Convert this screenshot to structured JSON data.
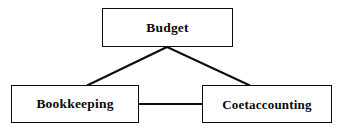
{
  "diagram": {
    "type": "hierarchy-tree",
    "background_color": "#ffffff",
    "line_color": "#0d0d0d",
    "text_color": "#0a0a0a",
    "nodes": [
      {
        "id": "budget",
        "label": "Budget",
        "level": "root"
      },
      {
        "id": "bookkeeping",
        "label": "Bookkeeping",
        "level": "child"
      },
      {
        "id": "costaccounting",
        "label": "Coetaccounting",
        "level": "child"
      }
    ],
    "edges": [
      {
        "from": "budget",
        "to": "bookkeeping",
        "style": "diagonal"
      },
      {
        "from": "budget",
        "to": "costaccounting",
        "style": "diagonal"
      },
      {
        "from": "bookkeeping",
        "to": "costaccounting",
        "style": "horizontal"
      }
    ]
  }
}
